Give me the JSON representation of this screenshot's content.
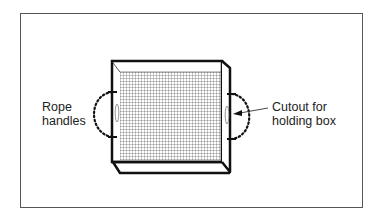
{
  "diagram": {
    "title": "",
    "labels": {
      "rope_handles": {
        "line1": "Rope",
        "line2": "handles"
      },
      "cutout": {
        "line1": "Cutout for",
        "line2": "holding box"
      }
    },
    "colors": {
      "stroke": "#111111",
      "frame": "#555555",
      "mesh": "#444444",
      "background": "#ffffff"
    }
  }
}
